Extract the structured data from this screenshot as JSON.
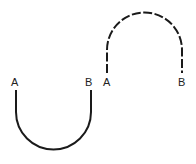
{
  "figures": [
    {
      "name": "u-curve",
      "style": "solid",
      "shape": "U (opens upward)",
      "labels": {
        "left": "A",
        "right": "B"
      }
    },
    {
      "name": "arch-curve",
      "style": "dashed",
      "shape": "inverted U (opens downward)",
      "labels": {
        "left": "A",
        "right": "B"
      }
    }
  ],
  "colors": {
    "stroke": "#1a1a1a",
    "text": "#222222",
    "background": "#ffffff"
  }
}
